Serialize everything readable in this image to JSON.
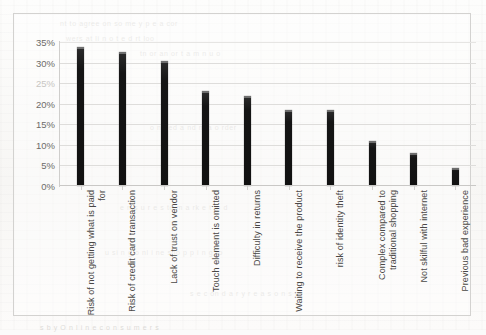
{
  "chart_data": {
    "type": "bar",
    "title": "",
    "xlabel": "",
    "ylabel": "",
    "ylim": [
      0,
      35
    ],
    "grid": true,
    "legend": "none",
    "value_format": "percent",
    "categories": [
      "Risk of not getting what is paid for",
      "Risk of credit card transaction",
      "Lack of trust on vendor",
      "Touch element is omitted",
      "Difficulty in returns",
      "Waiting to receive the product",
      "risk of identity theft",
      "Complex compared to traditional shopping",
      "Not skilful with internet",
      "Previous bad experience"
    ],
    "values": [
      33.8,
      32.5,
      30.5,
      23.0,
      22.0,
      18.5,
      18.5,
      11.0,
      8.0,
      4.5
    ],
    "yticks": [
      "0%",
      "5%",
      "10%",
      "15%",
      "20%",
      "25%",
      "30%",
      "35%"
    ],
    "ytick_values": [
      0,
      5,
      10,
      15,
      20,
      25,
      30,
      35
    ],
    "bar_color": "#141414",
    "gridline_color": "#dedddb",
    "plot_background": "#ffffff"
  },
  "ghost": {
    "lines": [
      "nt  to  agree   on  so  me   y   p  e  a  cor",
      "wers   at   li  n  o  t  e  d        rt   loo",
      "tn or  an  or   t a m n u o",
      "o ne ed   a nd    m a o rder",
      "e n s u r e s  to  m a  rk e t    in  d",
      "u si n   g  o nl i ne   sho  p p i n g    to",
      "s e c  on d  a  r y   r  e a s o n s",
      "e x  p e r i e n c e  o f   c  o n s  u m e r"
    ],
    "footer": "s   b y  O n l  i n e   c o n s u  m e  r s"
  }
}
